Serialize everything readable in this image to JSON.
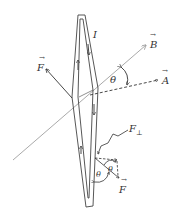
{
  "diagram": {
    "type": "physics-diagram",
    "colors": {
      "ink": "#333333",
      "field_line": "#aaaaaa",
      "background": "#ffffff"
    },
    "labels": {
      "current": "I",
      "magnetic_field": "B",
      "area_vector": "A",
      "force_upper": "F",
      "force_lower": "F",
      "force_perpendicular": "F",
      "perp_subscript": "⊥",
      "angle_main": "θ",
      "angle_lower_left": "θ",
      "angle_lower_right": "θ",
      "vector_arrow": "→"
    }
  }
}
